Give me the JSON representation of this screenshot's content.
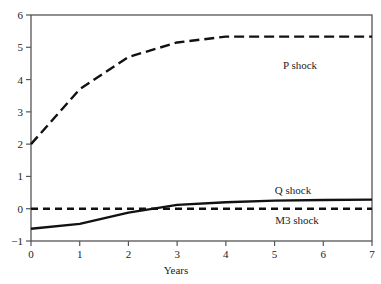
{
  "chart_data": {
    "type": "line",
    "title": "",
    "xlabel": "Years",
    "ylabel": "",
    "xlim": [
      0,
      7
    ],
    "ylim": [
      -1,
      6
    ],
    "x_ticks": [
      "0",
      "1",
      "2",
      "3",
      "4",
      "5",
      "6",
      "7"
    ],
    "y_ticks": [
      "−1",
      "0",
      "1",
      "2",
      "3",
      "4",
      "5",
      "6"
    ],
    "grid": false,
    "legend": "inline labels",
    "x": [
      0,
      1,
      2,
      3,
      4,
      5,
      6,
      7
    ],
    "series": [
      {
        "name": "P shock",
        "style": "long-dash",
        "values": [
          2.0,
          3.7,
          4.7,
          5.15,
          5.33,
          5.33,
          5.33,
          5.33
        ]
      },
      {
        "name": "Q shock",
        "style": "solid",
        "values": [
          -0.62,
          -0.47,
          -0.12,
          0.12,
          0.2,
          0.25,
          0.27,
          0.28
        ]
      },
      {
        "name": "M3 shock",
        "style": "short-dash",
        "values": [
          0,
          0,
          0,
          0,
          0,
          0,
          0,
          0
        ]
      }
    ]
  },
  "labels": {
    "p_shock": "P shock",
    "q_shock": "Q shock",
    "m3_shock": "M3 shock",
    "xlabel": "Years"
  }
}
